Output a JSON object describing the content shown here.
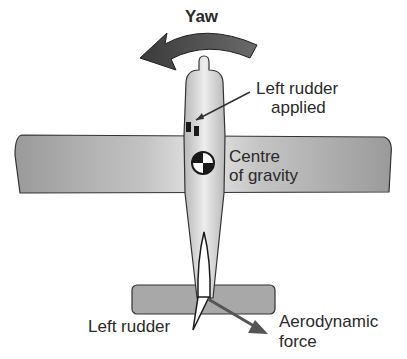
{
  "diagram": {
    "title": "Yaw",
    "labels": {
      "yaw": "Yaw",
      "left_rudder_applied_line1": "Left rudder",
      "left_rudder_applied_line2": "applied",
      "centre_of_gravity_line1": "Centre",
      "centre_of_gravity_line2": "of gravity",
      "left_rudder": "Left rudder",
      "aerodynamic_force_line1": "Aerodynamic",
      "aerodynamic_force_line2": "force"
    },
    "icons": [
      "yaw-arrow-icon",
      "centre-of-gravity-icon",
      "rudder-pedal-icon",
      "force-arrow-icon"
    ],
    "colors": {
      "aircraft_fill": "#a8a8a8",
      "fuselage_light": "#e2e2e2",
      "outline": "#2a2a2a",
      "arrow": "#4a4a4a",
      "text": "#2a2a2a",
      "background": "#ffffff"
    }
  }
}
